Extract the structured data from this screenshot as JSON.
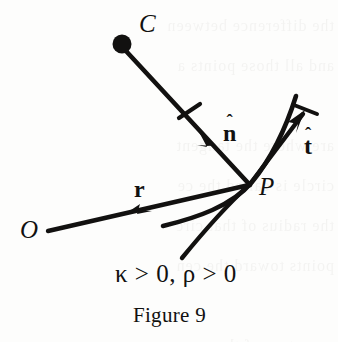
{
  "figure": {
    "caption": "Figure 9",
    "condition_text": "κ > 0, ρ > 0",
    "background_color": "#fdfdfc",
    "ink_color": "#121110"
  },
  "labels": {
    "center_of_curvature": "C",
    "origin": "O",
    "point_on_curve": "P",
    "position_vector": "r",
    "unit_normal": "n",
    "unit_tangent": "t",
    "hat_mark": "ˆ"
  },
  "geometry": {
    "center_point": {
      "x": 122,
      "y": 44,
      "radius": 9
    },
    "curve_point_P": {
      "x": 249,
      "y": 184
    },
    "origin_point_O": {
      "x": 48,
      "y": 230
    },
    "normal_vector": {
      "from": "C",
      "to": "P",
      "tick_at": {
        "x": 190,
        "y": 118
      },
      "arrow_at": {
        "x": 213,
        "y": 143
      }
    },
    "tangent_vector": {
      "from": "P",
      "to": {
        "x": 305,
        "y": 110
      },
      "has_end_bar": true
    },
    "curve": {
      "start": {
        "x": 163,
        "y": 226
      },
      "through": "P",
      "end": {
        "x": 296,
        "y": 96
      }
    },
    "secant_line": {
      "start": {
        "x": 182,
        "y": 258
      },
      "end": "P"
    }
  },
  "background_ghost_text": {
    "line1": "the difference between",
    "line2": "and all those points a",
    "line3": "",
    "line4": "are where the tangent",
    "line5": "circle is called the ce",
    "line6": "the radius of that circ",
    "line7": "points toward the cen",
    "line8": "",
    "line9": "curvature of the curv"
  }
}
